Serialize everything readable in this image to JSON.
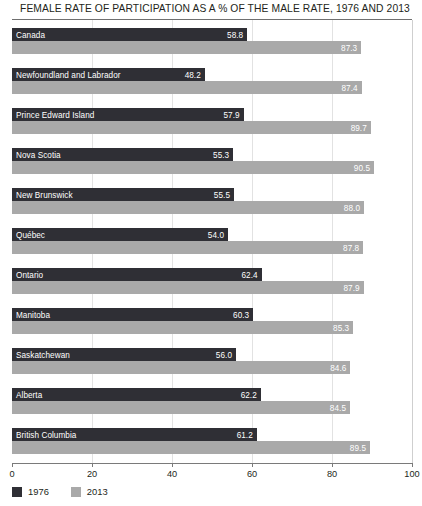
{
  "chart_data": {
    "type": "bar",
    "orientation": "horizontal",
    "title": "FEMALE RATE OF PARTICIPATION AS A % OF THE MALE RATE, 1976 AND 2013",
    "xlabel": "",
    "ylabel": "",
    "xlim": [
      0,
      100
    ],
    "xticks": [
      0,
      20,
      40,
      60,
      80,
      100
    ],
    "xtick_labels": [
      "0",
      "20",
      "40",
      "60",
      "80",
      "100"
    ],
    "grid": true,
    "legend_position": "bottom-left",
    "categories": [
      "Canada",
      "Newfoundland and Labrador",
      "Prince Edward Island",
      "Nova Scotia",
      "New Brunswick",
      "Québec",
      "Ontario",
      "Manitoba",
      "Saskatchewan",
      "Alberta",
      "British Columbia"
    ],
    "series": [
      {
        "name": "1976",
        "color": "#2f2f35",
        "values": [
          58.8,
          48.2,
          57.9,
          55.3,
          55.5,
          54.0,
          62.4,
          60.3,
          56.0,
          62.2,
          61.2
        ],
        "labels": [
          "58.8",
          "48.2",
          "57.9",
          "55.3",
          "55.5",
          "54.0",
          "62.4",
          "60.3",
          "56.0",
          "62.2",
          "61.2"
        ]
      },
      {
        "name": "2013",
        "color": "#a9a9a9",
        "values": [
          87.3,
          87.4,
          89.7,
          90.5,
          88.0,
          87.8,
          87.9,
          85.3,
          84.6,
          84.5,
          89.5
        ],
        "labels": [
          "87.3",
          "87.4",
          "89.7",
          "90.5",
          "88.0",
          "87.8",
          "87.9",
          "85.3",
          "84.6",
          "84.5",
          "89.5"
        ]
      }
    ]
  },
  "legend": {
    "items": [
      {
        "label": "1976",
        "color": "#2f2f35"
      },
      {
        "label": "2013",
        "color": "#a9a9a9"
      }
    ]
  }
}
